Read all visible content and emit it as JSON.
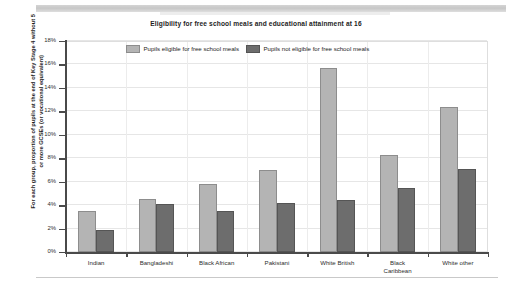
{
  "chart_data": {
    "type": "bar",
    "title": "Eligibility for free school meals and educational attainment at 16",
    "xlabel": "",
    "ylabel": "For each group, proportion of pupils at the end of Key Stage 4 without 5 or more GCSEs (or vocational equivalent)",
    "categories": [
      "Indian",
      "Bangladeshi",
      "Black African",
      "Pakistani",
      "White British",
      "Black Caribbean",
      "White other"
    ],
    "series": [
      {
        "name": "Pupils eligible for free school meals",
        "color": "#b4b4b4",
        "values": [
          3.5,
          4.5,
          5.8,
          7.0,
          15.7,
          8.3,
          12.4
        ]
      },
      {
        "name": "Pupils not eligible for free school meals",
        "color": "#6d6d6d",
        "values": [
          1.9,
          4.1,
          3.5,
          4.2,
          4.4,
          5.5,
          7.1
        ]
      }
    ],
    "ylim": [
      0,
      18
    ],
    "ytick_step": 2,
    "ytick_labels": [
      "0%",
      "2%",
      "4%",
      "6%",
      "8%",
      "10%",
      "12%",
      "14%",
      "16%",
      "18%"
    ],
    "grid": true,
    "legend_position": "top-center"
  }
}
